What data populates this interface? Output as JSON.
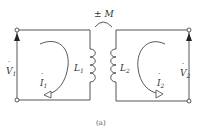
{
  "diagram": {
    "caption": "(a)",
    "mutual_label": "± M",
    "left": {
      "voltage_label": "V",
      "voltage_sub": "1",
      "current_label": "I",
      "current_sub": "1",
      "inductor_label": "L",
      "inductor_sub": "1"
    },
    "right": {
      "voltage_label": "V",
      "voltage_sub": "2",
      "current_label": "I",
      "current_sub": "2",
      "inductor_label": "L",
      "inductor_sub": "2"
    },
    "colors": {
      "line": "#444444",
      "text": "#333333"
    }
  }
}
